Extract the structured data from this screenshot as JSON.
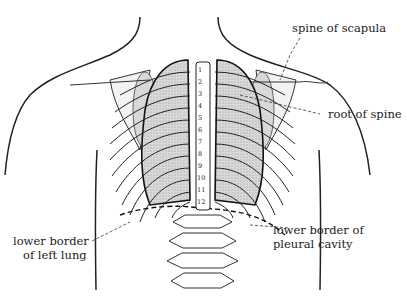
{
  "figure": {
    "labels": {
      "spine_of_scapula": "spine of scapula",
      "root_of_spine": "root of spine",
      "lower_border_pleural": [
        "lower border of",
        "pleural cavity"
      ],
      "lower_border_lung": [
        "lower border",
        "of left lung"
      ]
    },
    "vertebra_numbers": [
      "1",
      "2",
      "3",
      "4",
      "5",
      "6",
      "7",
      "8",
      "9",
      "10",
      "11",
      "12"
    ]
  }
}
